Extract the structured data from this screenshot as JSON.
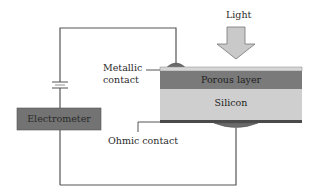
{
  "diagram": {
    "labels": {
      "light": "Light",
      "metallic_contact_line1": "Metallic",
      "metallic_contact_line2": "contact",
      "porous_layer": "Porous layer",
      "silicon": "Silicon",
      "electrometer": "Electrometer",
      "ohmic_contact": "Ohmic contact"
    },
    "colors": {
      "wire": "#555555",
      "top_film": "#d6d6d6",
      "porous_layer": "#7a7a7a",
      "silicon": "#cfcfcf",
      "bottom_strip": "#4a4a4a",
      "contact": "#6a6a6a",
      "electrometer_box": "#737373",
      "light_arrow": "#c9c9c9"
    },
    "components": [
      "light-arrow",
      "metallic-contact",
      "porous-layer",
      "silicon-substrate",
      "ohmic-contact",
      "electrometer",
      "battery"
    ]
  }
}
